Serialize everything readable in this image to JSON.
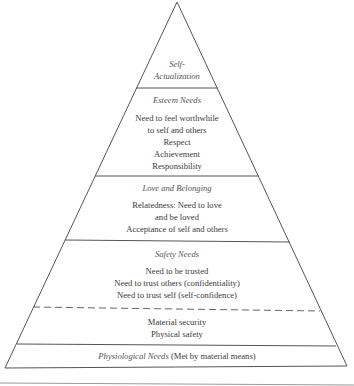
{
  "diagram": {
    "type": "pyramid",
    "levels": [
      {
        "title": "Self-",
        "title2": "Actualization",
        "items": []
      },
      {
        "title": "Esteem Needs",
        "items": [
          "Need to feel worthwhile",
          "to self and others",
          "Respect",
          "Achievement",
          "Responsibility"
        ]
      },
      {
        "title": "Love and Belonging",
        "items": [
          "Relatedness: Need to love",
          "and be loved",
          "Acceptance of self and others"
        ]
      },
      {
        "title": "Safety Needs",
        "items": [
          "Need to be trusted",
          "Need to trust others (confidentiality)",
          "Need to trust self (self-confidence)"
        ],
        "sub_items": [
          "Material security",
          "Physical safety"
        ]
      },
      {
        "title": "Physiological Needs",
        "suffix": " (Met by material means)",
        "items": []
      }
    ],
    "colors": {
      "stroke": "#555555",
      "text": "#3a3a3a",
      "rule": "#9a9a9a"
    }
  }
}
